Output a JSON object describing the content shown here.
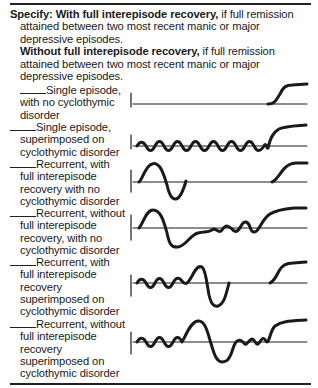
{
  "specifier": {
    "label": "Specify:",
    "with_recovery": {
      "term": "With full interepisode recovery,",
      "definition_lines": [
        " if full remission",
        "attained between two most recent manic or major",
        "depressive episodes."
      ]
    },
    "without_recovery": {
      "term": "Without full interepisode recovery,",
      "definition_lines": [
        " if full remission",
        "attained between two most recent manic or major",
        "depressive episodes."
      ]
    }
  },
  "courses": [
    {
      "lines": [
        "Single episode,",
        "with no cyclothymic",
        "disorder"
      ],
      "graph": "single-episode-no-cyclothymic"
    },
    {
      "lines": [
        "Single episode,",
        "superimposed on",
        "cyclothymic disorder"
      ],
      "graph": "single-episode-cyclothymic"
    },
    {
      "lines": [
        "Recurrent, with",
        "full interepisode",
        "recovery with no",
        "cyclothymic disorder"
      ],
      "graph": "recurrent-full-recovery-no-cyclothymic"
    },
    {
      "lines": [
        "Recurrent, without",
        "full interepisode",
        "recovery, with no",
        "cyclothymic disorder"
      ],
      "graph": "recurrent-no-full-recovery-no-cyclothymic"
    },
    {
      "lines": [
        "Recurrent, with",
        "full interepisode",
        "recovery",
        "superimposed on",
        "cyclothymic disorder"
      ],
      "graph": "recurrent-full-recovery-cyclothymic"
    },
    {
      "lines": [
        "Recurrent, without",
        "full interepisode",
        "recovery",
        "superimposed on",
        "cyclothymic disorder"
      ],
      "graph": "recurrent-no-full-recovery-cyclothymic"
    }
  ],
  "colors": {
    "ink": "#1a1a1a",
    "background": "#ffffff"
  }
}
